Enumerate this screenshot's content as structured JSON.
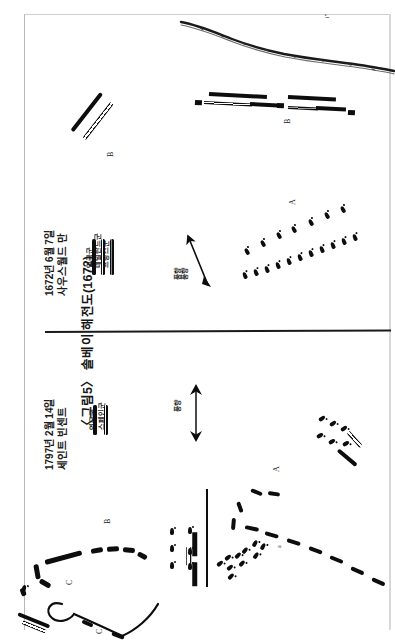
{
  "page": {
    "background_color": "#ffffff",
    "ink_color": "#0d0d0d",
    "border_color": "#b8b8b8"
  },
  "caption": {
    "figure_label": "〈그림5〉",
    "text": "〈그림5〉 솔베이 해전도(1672)"
  },
  "panels": [
    {
      "id": "solebay",
      "title": "사우스월드 만",
      "date": "1672년 6월 7일",
      "wind_label": "풍향",
      "wind_label_duplicate": "풍향",
      "legend": [
        {
          "name": "프랑스군",
          "swatch": "grey-outline"
        },
        {
          "name": "네덜란드군",
          "swatch": "hollow-outline"
        },
        {
          "name": "영국군",
          "swatch": "solid"
        }
      ],
      "markers": [
        {
          "label": "A"
        },
        {
          "label": "B"
        },
        {
          "label": "B"
        }
      ],
      "corner_mark": "i\""
    },
    {
      "id": "saint-vincent",
      "title": "세인트 빈센트",
      "date": "1797년 2월 14일",
      "wind_label": "풍향",
      "legend": [
        {
          "name": "스페인군",
          "swatch": "hollow-outline"
        },
        {
          "name": "영국군",
          "swatch": "solid"
        }
      ],
      "markers": [
        {
          "label": "A"
        },
        {
          "label": "a"
        },
        {
          "label": "B"
        },
        {
          "label": "C"
        },
        {
          "label": "C"
        }
      ]
    }
  ]
}
